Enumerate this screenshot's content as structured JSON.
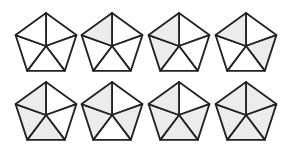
{
  "diagram": {
    "colors": {
      "fill": "#ececec",
      "empty": "#ffffff",
      "stroke": "#222222"
    },
    "triangle_order": [
      "top-right",
      "right-bottom",
      "bottom",
      "left-bottom",
      "top-left"
    ],
    "pentagons": [
      {
        "id": 1,
        "cx": 46,
        "cy": 45,
        "r": 32,
        "shaded": []
      },
      {
        "id": 2,
        "cx": 112,
        "cy": 45,
        "r": 32,
        "shaded": [
          "top-left"
        ]
      },
      {
        "id": 3,
        "cx": 179,
        "cy": 45,
        "r": 32,
        "shaded": [
          "top-left",
          "left-bottom"
        ]
      },
      {
        "id": 4,
        "cx": 246,
        "cy": 45,
        "r": 32,
        "shaded": [
          "top-left",
          "right-bottom"
        ]
      },
      {
        "id": 5,
        "cx": 46,
        "cy": 114,
        "r": 32,
        "shaded": [
          "top-left",
          "left-bottom",
          "bottom"
        ]
      },
      {
        "id": 6,
        "cx": 112,
        "cy": 114,
        "r": 32,
        "shaded": [
          "top-left",
          "left-bottom",
          "right-bottom"
        ]
      },
      {
        "id": 7,
        "cx": 179,
        "cy": 114,
        "r": 32,
        "shaded": [
          "top-left",
          "left-bottom",
          "bottom",
          "right-bottom"
        ]
      },
      {
        "id": 8,
        "cx": 246,
        "cy": 114,
        "r": 32,
        "shaded": [
          "top-right",
          "right-bottom",
          "bottom",
          "left-bottom",
          "top-left"
        ]
      }
    ]
  }
}
